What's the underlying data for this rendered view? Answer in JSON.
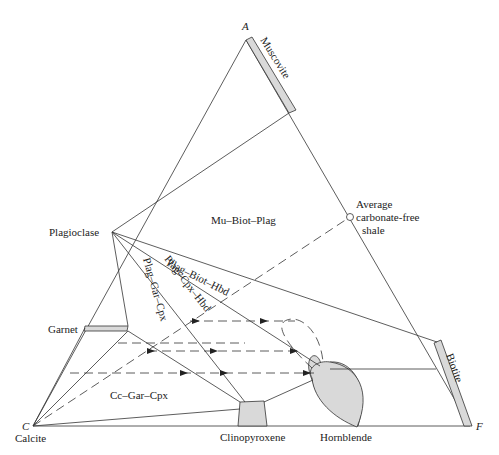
{
  "vertices": {
    "A": "A",
    "C": "C",
    "F": "F"
  },
  "minerals": {
    "muscovite": "Muscovite",
    "biotite": "Biotite",
    "plagioclase": "Plagioclase",
    "garnet": "Garnet",
    "calcite": "Calcite",
    "clinopyroxene": "Clinopyroxene",
    "hornblende": "Hornblende"
  },
  "composition_point": {
    "line1": "Average",
    "line2": "carbonate-free",
    "line3": "shale"
  },
  "assemblages": {
    "mu_biot_plag": "Mu–Biot–Plag",
    "plag_biot_hbd": "Plag–Biot–Hbd",
    "plag_cpx_hbd": "Plag–Cpx–Hbd",
    "plag_gar_cpx": "Plag–Gar–Cpx",
    "cc_gar_cpx": "Cc–Gar–Cpx"
  },
  "colors": {
    "phase_fill": "#d9d9d9",
    "line": "#333333"
  }
}
